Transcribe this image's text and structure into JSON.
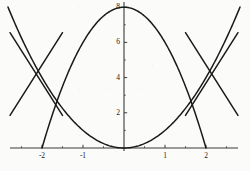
{
  "chart_data": {
    "type": "line",
    "title": "",
    "subtitle": "",
    "xlabel": "",
    "ylabel": "",
    "xlim": [
      -2.78,
      2.78
    ],
    "ylim": [
      -0.35,
      8.3
    ],
    "grid": false,
    "legend": null,
    "axis_color": "#3a3a3a",
    "curve_color": "#1a1a1a",
    "background_color": "#fbfbfa",
    "x_ticks": [
      {
        "value": -2,
        "label": "-2"
      },
      {
        "value": -1,
        "label": "-1"
      },
      {
        "value": 1,
        "label": "1"
      },
      {
        "value": 2,
        "label": "2"
      }
    ],
    "x_minor_ticks": [
      -2.5,
      -1.5,
      -0.5,
      0.5,
      1.5,
      2.5
    ],
    "y_ticks": [
      {
        "value": 2,
        "label": "2"
      },
      {
        "value": 4,
        "label": "4"
      },
      {
        "value": 6,
        "label": "6"
      },
      {
        "value": 8,
        "label": "8"
      }
    ],
    "y_minor_ticks": [
      1,
      3,
      5,
      7
    ],
    "series": [
      {
        "name": "downward parabola",
        "type": "line",
        "equation": "y = 8 - 2x^2",
        "vertex": [
          0,
          8
        ],
        "x_range": [
          -2,
          2
        ],
        "x": [
          -2,
          -1.75,
          -1.5,
          -1.25,
          -1,
          -0.75,
          -0.5,
          -0.25,
          0,
          0.25,
          0.5,
          0.75,
          1,
          1.25,
          1.5,
          1.75,
          2
        ],
        "values": [
          0,
          1.875,
          3.5,
          4.875,
          6,
          6.875,
          7.5,
          7.875,
          8,
          7.875,
          7.5,
          6.875,
          6,
          4.875,
          3.5,
          1.875,
          0
        ]
      },
      {
        "name": "upward parabola",
        "type": "line",
        "equation": "y = x^2",
        "vertex": [
          0,
          0
        ],
        "x_range": [
          -2.83,
          2.83
        ],
        "x": [
          -2.83,
          -2.5,
          -2,
          -1.5,
          -1,
          -0.5,
          0,
          0.5,
          1,
          1.5,
          2,
          2.5,
          2.83
        ],
        "values": [
          8,
          6.25,
          4,
          2.25,
          1,
          0.25,
          0,
          0.25,
          1,
          2.25,
          4,
          6.25,
          8
        ]
      },
      {
        "name": "left descending line",
        "type": "line",
        "x": [
          -2.78,
          -1.5
        ],
        "values": [
          6.55,
          1.85
        ]
      },
      {
        "name": "left ascending line",
        "type": "line",
        "x": [
          -2.78,
          -1.5
        ],
        "values": [
          1.85,
          6.55
        ]
      },
      {
        "name": "right ascending line",
        "type": "line",
        "x": [
          1.5,
          2.78
        ],
        "values": [
          1.85,
          6.55
        ]
      },
      {
        "name": "right descending line",
        "type": "line",
        "x": [
          1.5,
          2.78
        ],
        "values": [
          6.55,
          1.85
        ]
      }
    ],
    "annotations": [],
    "intersections": [
      {
        "point": [
          -2,
          4
        ],
        "label": ""
      },
      {
        "point": [
          2,
          4
        ],
        "label": ""
      }
    ]
  }
}
